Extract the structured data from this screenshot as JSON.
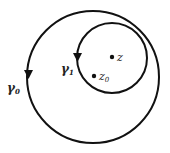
{
  "diagram": {
    "title": "",
    "colors": {
      "stroke": "#111111",
      "text": "#222222",
      "background": "#ffffff"
    },
    "curves": [
      {
        "id": "gamma0",
        "label": "γ",
        "subscript": "0",
        "cx": 93,
        "cy": 77,
        "r": 66,
        "direction": "counterclockwise"
      },
      {
        "id": "gamma1",
        "label": "γ",
        "subscript": "1",
        "cx": 112,
        "cy": 58,
        "r": 35,
        "direction": "counterclockwise"
      }
    ],
    "points": [
      {
        "id": "z",
        "label": "z",
        "subscript": "",
        "x": 112,
        "y": 57
      },
      {
        "id": "z0",
        "label": "z",
        "subscript": "0",
        "x": 94,
        "y": 76
      }
    ]
  }
}
